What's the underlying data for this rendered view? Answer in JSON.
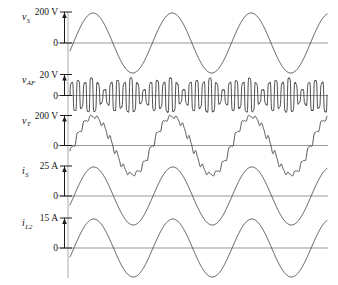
{
  "figure": {
    "type": "multi-panel-waveform-plot",
    "background_color": "#ffffff",
    "trace_color": "#3b3b3b",
    "axis_color": "#9a9a9a",
    "width": 338,
    "height": 285
  },
  "chart_data": {
    "type": "line",
    "title": "",
    "xlabel": "",
    "ylabel": "",
    "grid": false,
    "legend": "none",
    "x_range_cycles": 3.25,
    "panels": [
      {
        "id": "vS",
        "signal_label": "v",
        "signal_subscript": "S",
        "scale_label": "200 V",
        "scale_value": 200,
        "unit": "V",
        "zero_label": "0",
        "waveform": "sine",
        "cycles": 3.25,
        "amplitude_in_scale_units": 180,
        "phase_deg": -15,
        "ripple": false
      },
      {
        "id": "vAF",
        "signal_label": "v",
        "signal_subscript": "AF",
        "scale_label": "20 V",
        "scale_value": 20,
        "unit": "V",
        "zero_label": "0",
        "waveform": "high-frequency-modulated-oscillation",
        "cycles": 3.25,
        "carrier_cycles": 39,
        "amplitude_in_scale_units": 18,
        "phase_deg": -15,
        "ripple": true
      },
      {
        "id": "vT",
        "signal_label": "v",
        "signal_subscript": "T",
        "scale_label": "200 V",
        "scale_value": 200,
        "unit": "V",
        "zero_label": "0",
        "waveform": "sine-with-ripple",
        "cycles": 3.25,
        "amplitude_in_scale_units": 175,
        "phase_deg": -15,
        "ripple": true,
        "ripple_cycles": 39,
        "ripple_amplitude_in_scale_units": 18
      },
      {
        "id": "iS",
        "signal_label": "i",
        "signal_subscript": "S",
        "scale_label": "25 A",
        "scale_value": 25,
        "unit": "A",
        "zero_label": "0",
        "waveform": "sine",
        "cycles": 3.25,
        "amplitude_in_scale_units": 24,
        "phase_deg": -18,
        "ripple": false
      },
      {
        "id": "iL2",
        "signal_label": "i",
        "signal_subscript": "L2",
        "scale_label": "15 A",
        "scale_value": 15,
        "unit": "A",
        "zero_label": "0",
        "waveform": "sine",
        "cycles": 3.25,
        "amplitude_in_scale_units": 14,
        "phase_deg": -18,
        "ripple": false
      }
    ]
  }
}
